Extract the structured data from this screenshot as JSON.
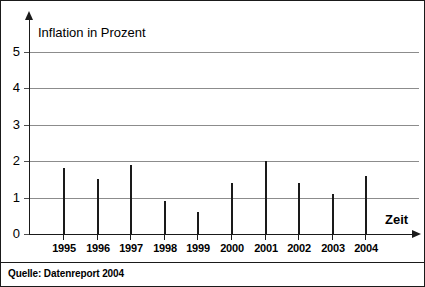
{
  "chart_data": {
    "type": "bar",
    "title": "Inflation in Prozent",
    "xlabel": "Zeit",
    "ylabel": "",
    "categories": [
      "1995",
      "1996",
      "1997",
      "1998",
      "1999",
      "2000",
      "2001",
      "2002",
      "2003",
      "2004"
    ],
    "values": [
      1.8,
      1.5,
      1.9,
      0.9,
      0.6,
      1.4,
      2.0,
      1.4,
      1.1,
      1.6
    ],
    "ylim": [
      0,
      5.5
    ],
    "yticks": [
      0,
      1,
      2,
      3,
      4,
      5
    ],
    "ytick_labels": [
      "0",
      "1",
      "2",
      "3",
      "4",
      "5"
    ],
    "grid": true,
    "legend": false,
    "series_color": "#1a1a1a",
    "gridline_color": "#8c8c8c",
    "axis_color": "#1a1a1a"
  },
  "footer": {
    "source": "Quelle: Datenreport 2004"
  }
}
